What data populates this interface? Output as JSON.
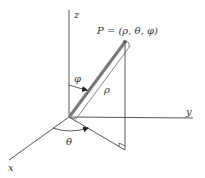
{
  "diagram": {
    "point_label": "P = (ρ, θ, φ)",
    "axes": {
      "x": "x",
      "y": "y",
      "z": "z"
    },
    "angle_labels": {
      "theta": "θ",
      "phi": "φ"
    },
    "radius_label": "ρ",
    "colors": {
      "line": "#444444",
      "rod": "#777777",
      "background": "#ffffff"
    }
  }
}
